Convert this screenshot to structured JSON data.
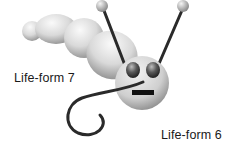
{
  "illustration": {
    "subject": "cartoon caterpillar-like creature with antennae",
    "colors": {
      "body_light": "#e8e8e8",
      "body_shadow": "#9a9a9a",
      "outline": "#2a2a2a",
      "eyes": "#555555"
    }
  },
  "labels": {
    "life_form_7": "Life-form 7",
    "life_form_6": "Life-form 6"
  }
}
